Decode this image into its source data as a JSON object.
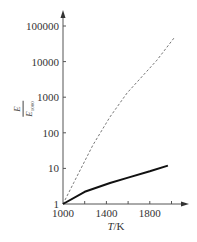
{
  "chart_data": {
    "type": "line",
    "title": "",
    "xlabel": "T/K",
    "ylabel": "E / E_1000",
    "ylabel_parts": {
      "numerator": "E",
      "denominator": "E",
      "denominator_sub": "1000"
    },
    "yscale": "log",
    "xlim": [
      1000,
      2080
    ],
    "ylim": [
      1,
      100000
    ],
    "x_ticks": [
      1000,
      1200,
      1400,
      1600,
      1800,
      2000
    ],
    "x_tick_labels": [
      "1000",
      "",
      "1400",
      "",
      "1800",
      ""
    ],
    "y_ticks": [
      1,
      10,
      100,
      1000,
      10000,
      100000
    ],
    "y_tick_labels": [
      "1",
      "10",
      "100",
      "1000",
      "10000",
      "100000"
    ],
    "grid": false,
    "legend": null,
    "series": [
      {
        "name": "dashed curve",
        "style": "dashed",
        "x": [
          1000,
          1100,
          1276,
          1433,
          1590,
          1866,
          2023
        ],
        "y": [
          1,
          4,
          45,
          280,
          1300,
          11000,
          46000
        ]
      },
      {
        "name": "solid curve",
        "style": "solid",
        "x": [
          1000,
          1200,
          1433,
          1600,
          1800,
          1967
        ],
        "y": [
          1,
          2.2,
          3.9,
          5.5,
          8.3,
          12
        ]
      }
    ]
  }
}
